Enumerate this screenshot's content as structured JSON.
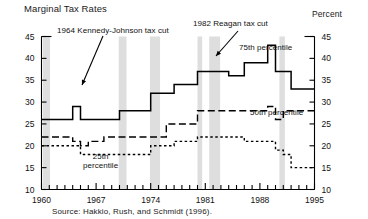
{
  "chart_title": "Marginal Tax Rates",
  "percent_label": "Percent",
  "source_note": "Source: Hakkio, Rush, and Schmidt (1996).",
  "annotations": {
    "kennedy": "1964 Kennedy-Johnson tax cut",
    "reagan": "1982 Reagan tax cut",
    "p75": "75th percentile",
    "p50": "50th percentile",
    "p25_line1": "25th",
    "p25_line2": "percentile"
  },
  "chart_data": {
    "type": "line",
    "title": "Marginal Tax Rates",
    "xlabel": "",
    "ylabel": "Percent",
    "xlim": [
      1960,
      1995
    ],
    "ylim": [
      10,
      45
    ],
    "yticks": [
      10,
      15,
      20,
      25,
      30,
      35,
      40,
      45
    ],
    "xticks": [
      1960,
      1967,
      1974,
      1981,
      1988,
      1995
    ],
    "xtick_labels": [
      "1960",
      "1967",
      "1974",
      "1981",
      "1988",
      "1995"
    ],
    "ytick_labels": [
      "10",
      "15",
      "20",
      "25",
      "30",
      "35",
      "40",
      "45"
    ],
    "grid": false,
    "legend": "inline-annotations",
    "minor_xticks_every": 1,
    "recession_bands": [
      {
        "start": 1960.2,
        "end": 1961.1
      },
      {
        "start": 1969.9,
        "end": 1970.9
      },
      {
        "start": 1973.9,
        "end": 1975.2
      },
      {
        "start": 1980.0,
        "end": 1980.6
      },
      {
        "start": 1981.5,
        "end": 1982.9
      },
      {
        "start": 1990.5,
        "end": 1991.2
      }
    ],
    "x": [
      1960,
      1961,
      1962,
      1963,
      1964,
      1965,
      1966,
      1967,
      1968,
      1969,
      1970,
      1971,
      1972,
      1973,
      1974,
      1975,
      1976,
      1977,
      1978,
      1979,
      1980,
      1981,
      1982,
      1983,
      1984,
      1985,
      1986,
      1987,
      1988,
      1989,
      1990,
      1991,
      1992,
      1993,
      1994
    ],
    "series": [
      {
        "name": "75th percentile",
        "style": "solid",
        "values": [
          26,
          26,
          26,
          26,
          29,
          26,
          26,
          26,
          26,
          26,
          28,
          28,
          28,
          28,
          32,
          32,
          32,
          34,
          34,
          34,
          37,
          37,
          37,
          37,
          36,
          36,
          39,
          39,
          39,
          43,
          37,
          37,
          33,
          33,
          33
        ]
      },
      {
        "name": "50th percentile",
        "style": "dashed",
        "values": [
          22,
          22,
          22,
          22,
          21,
          20,
          21,
          21,
          22,
          22,
          22,
          22,
          22,
          22,
          22,
          22,
          25,
          25,
          25,
          25,
          28,
          28,
          28,
          28,
          28,
          28,
          28,
          28,
          28,
          29,
          26,
          28,
          28,
          28,
          28
        ]
      },
      {
        "name": "25th percentile",
        "style": "dotted",
        "values": [
          20,
          20,
          20,
          20,
          20,
          18,
          18,
          18,
          18,
          18,
          18,
          18,
          18,
          18,
          20,
          20,
          20,
          21,
          21,
          21,
          22,
          22,
          22,
          22,
          22,
          22,
          21,
          21,
          21,
          21,
          19,
          18,
          15,
          15,
          15
        ]
      }
    ]
  }
}
